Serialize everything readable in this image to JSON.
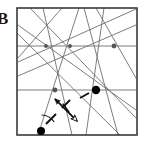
{
  "figure": {
    "label": "B",
    "caption": "",
    "width": 149,
    "height": 145,
    "background_color": "#ffffff"
  },
  "colors": {
    "border": "#3a3a3a",
    "arrangement_line": "#6e6e6e",
    "node_small": "#555555",
    "node_large": "#000000",
    "arrow": "#111111",
    "dashed_path": "#111111",
    "angle_arc": "#222222",
    "label_text": "#1a1a1a"
  },
  "chart_data": {
    "type": "diagram",
    "title": "",
    "subtitle": "",
    "xlabel": "",
    "ylabel": "",
    "grid": false,
    "legend": null,
    "bounding_square": {
      "name": "region-square",
      "x": 17,
      "y": 8,
      "width": 120,
      "height": 127,
      "stroke_width": 1.6
    },
    "lines": [
      {
        "id": "h1",
        "kind": "horizontal",
        "x1": 18,
        "y1": 46,
        "x2": 136,
        "y2": 46
      },
      {
        "id": "h2",
        "kind": "horizontal",
        "x1": 18,
        "y1": 90,
        "x2": 136,
        "y2": 90
      },
      {
        "id": "d1",
        "kind": "diagonal",
        "x1": 18,
        "y1": 25,
        "x2": 136,
        "y2": 110
      },
      {
        "id": "d2",
        "kind": "diagonal",
        "x1": 18,
        "y1": 62,
        "x2": 136,
        "y2": 9
      },
      {
        "id": "d3",
        "kind": "diagonal",
        "x1": 18,
        "y1": 76,
        "x2": 136,
        "y2": 25
      },
      {
        "id": "d4",
        "kind": "diagonal",
        "x1": 30,
        "y1": 8,
        "x2": 136,
        "y2": 118
      },
      {
        "id": "d5",
        "kind": "diagonal",
        "x1": 18,
        "y1": 34,
        "x2": 120,
        "y2": 135
      },
      {
        "id": "d6",
        "kind": "diagonal",
        "x1": 62,
        "y1": 8,
        "x2": 18,
        "y2": 58
      },
      {
        "id": "s1",
        "kind": "steep",
        "x1": 43,
        "y1": 8,
        "x2": 72,
        "y2": 135
      },
      {
        "id": "s2",
        "kind": "steep",
        "x1": 79,
        "y1": 8,
        "x2": 38,
        "y2": 135
      },
      {
        "id": "s3",
        "kind": "steep",
        "x1": 104,
        "y1": 8,
        "x2": 86,
        "y2": 135
      },
      {
        "id": "s4",
        "kind": "steep",
        "x1": 118,
        "y1": 135,
        "x2": 84,
        "y2": 8
      },
      {
        "id": "s5",
        "kind": "steep",
        "x1": 136,
        "y1": 78,
        "x2": 96,
        "y2": 8
      }
    ],
    "vertices": [
      {
        "id": "v1",
        "x": 46,
        "y": 46,
        "r": 1.9,
        "style": "small"
      },
      {
        "id": "v2",
        "x": 70,
        "y": 46,
        "r": 1.9,
        "style": "small"
      },
      {
        "id": "v3",
        "x": 114,
        "y": 46,
        "r": 2.4,
        "style": "small"
      },
      {
        "id": "v4",
        "x": 55,
        "y": 90,
        "r": 2.4,
        "style": "small"
      },
      {
        "id": "v5",
        "x": 96,
        "y": 90,
        "r": 4.2,
        "style": "large"
      },
      {
        "id": "v6",
        "x": 41,
        "y": 131,
        "r": 4.0,
        "style": "large"
      }
    ],
    "double_arrow": {
      "id": "bidirectional-arrow",
      "x1": 55,
      "y1": 99,
      "x2": 77,
      "y2": 121,
      "head_start": "filled",
      "head_end": "hollow",
      "stroke_width": 1.5
    },
    "dashed_segments": [
      {
        "id": "dash-a",
        "x1": 46,
        "y1": 124,
        "x2": 56,
        "y2": 114
      },
      {
        "id": "dash-b",
        "x1": 62,
        "y1": 108,
        "x2": 70,
        "y2": 100
      },
      {
        "id": "dash-c",
        "x1": 80,
        "y1": 98,
        "x2": 89,
        "y2": 93
      }
    ],
    "tick_marks": [
      {
        "id": "tick-1",
        "x1": 63,
        "y1": 104,
        "x2": 69,
        "y2": 112
      }
    ],
    "angle_arc": {
      "id": "angle-arc-at-v6",
      "cx": 41,
      "cy": 131,
      "radius": 16,
      "start_deg": -88,
      "end_deg": -34
    }
  }
}
